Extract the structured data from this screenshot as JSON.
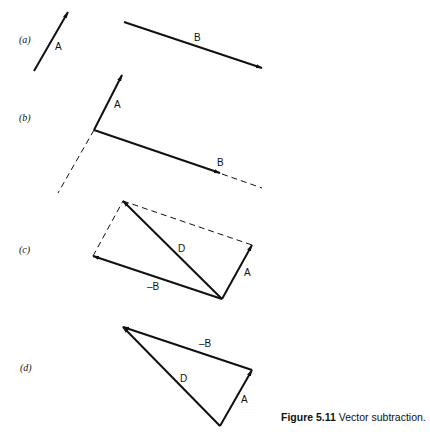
{
  "panels": {
    "a": {
      "label": "(a)",
      "vectors": {
        "A": "A",
        "B": "B"
      }
    },
    "b": {
      "label": "(b)",
      "vectors": {
        "A": "A",
        "B": "B"
      }
    },
    "c": {
      "label": "(c)",
      "vectors": {
        "D": "D",
        "A": "A",
        "negB": "–B"
      }
    },
    "d": {
      "label": "(d)",
      "vectors": {
        "negB": "–B",
        "D": "D",
        "A": "A"
      }
    }
  },
  "caption": {
    "number": "Figure 5.11",
    "text": "Vector subtraction."
  },
  "colors": {
    "ink": "#111111",
    "background": "#ffffff"
  }
}
